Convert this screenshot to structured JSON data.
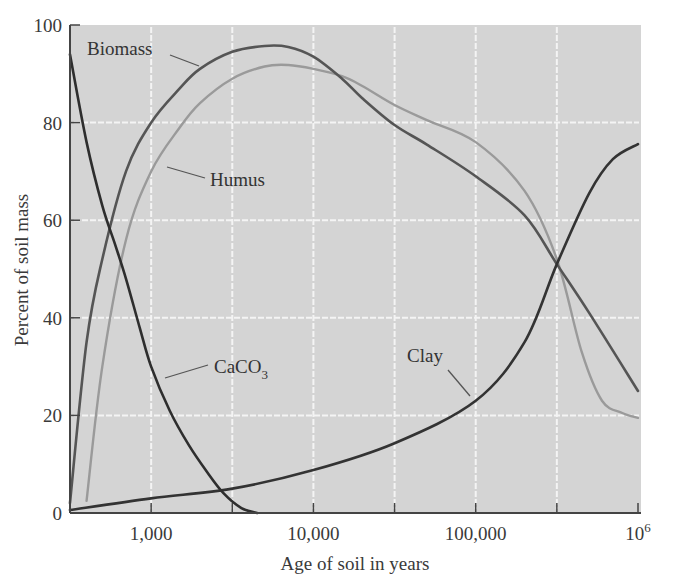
{
  "chart_data": {
    "type": "line",
    "title": "",
    "xlabel": "Age of soil in years",
    "ylabel": "Percent of soil mass",
    "xscale": "log",
    "xlim": [
      316,
      1000000
    ],
    "ylim": [
      0,
      100
    ],
    "grid": true,
    "legend": "inline labels",
    "x_ticks": [
      1000,
      3162,
      10000,
      31623,
      100000,
      316228,
      1000000
    ],
    "x_tick_labels": [
      {
        "value": 1000,
        "label": "1,000"
      },
      {
        "value": 10000,
        "label": "10,000"
      },
      {
        "value": 100000,
        "label": "100,000"
      },
      {
        "value": 1000000,
        "label": "10",
        "superscript": "6"
      }
    ],
    "y_ticks": [
      0,
      20,
      40,
      60,
      80,
      100
    ],
    "y_tick_labels": [
      "0",
      "20",
      "40",
      "60",
      "80",
      "100"
    ],
    "series": [
      {
        "name": "Biomass",
        "label": "Biomass",
        "color": "#555555",
        "width": 2.6,
        "x": [
          316,
          400,
          500,
          700,
          1000,
          1500,
          2000,
          3162,
          5000,
          7000,
          10000,
          15000,
          20000,
          31623,
          50000,
          100000,
          200000,
          316228,
          500000,
          1000000
        ],
        "values": [
          2,
          35,
          52,
          70,
          80,
          87,
          91,
          94.5,
          95.7,
          95.5,
          93.5,
          89,
          85,
          79.5,
          75.5,
          69,
          61,
          51,
          41,
          25
        ]
      },
      {
        "name": "Humus",
        "label": "Humus",
        "color": "#9a9a9a",
        "width": 2.4,
        "x": [
          400,
          500,
          700,
          1000,
          1500,
          2000,
          3162,
          5000,
          7000,
          10000,
          15000,
          20000,
          31623,
          50000,
          100000,
          200000,
          316228,
          450000,
          600000,
          800000,
          1000000
        ],
        "values": [
          2.5,
          30,
          56,
          70,
          79,
          84,
          89,
          91.5,
          91.8,
          91,
          89.5,
          87.5,
          83.6,
          80.5,
          76,
          66,
          52,
          33,
          23,
          20.5,
          19.5
        ]
      },
      {
        "name": "CaCO3",
        "label": "CaCO",
        "label_sub": "3",
        "color": "#2e2e2e",
        "width": 2.6,
        "x": [
          316,
          400,
          500,
          600,
          700,
          850,
          1000,
          1300,
          1700,
          2200,
          2800,
          3600,
          4500
        ],
        "values": [
          94,
          76,
          63,
          55,
          48,
          38,
          30,
          21,
          14,
          8.5,
          4,
          1,
          0
        ]
      },
      {
        "name": "Clay",
        "label": "Clay",
        "color": "#333333",
        "width": 2.6,
        "x": [
          316,
          1000,
          3162,
          10000,
          31623,
          100000,
          200000,
          316228,
          500000,
          700000,
          1000000
        ],
        "values": [
          0.6,
          3,
          5,
          8.8,
          14.3,
          23,
          35,
          51,
          65.5,
          72.5,
          75.6
        ]
      }
    ],
    "annotations": [
      {
        "text": "Biomass",
        "target_series": "Biomass"
      },
      {
        "text": "Humus",
        "target_series": "Humus"
      },
      {
        "text": "CaCO3",
        "target_series": "CaCO3"
      },
      {
        "text": "Clay",
        "target_series": "Clay"
      }
    ]
  },
  "style": {
    "plot_background": "#d4d4d4",
    "grid_color": "#f4f4f4",
    "axis_color": "#444444"
  }
}
